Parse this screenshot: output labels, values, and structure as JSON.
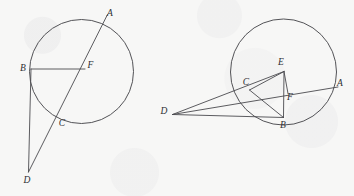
{
  "page": {
    "width": 354,
    "height": 196,
    "background_color": "#f7f7f6",
    "ink_color": "#4a4a4e",
    "label_color": "#2e2e32"
  },
  "figures": [
    {
      "id": "figure-left",
      "name": "left-circle-diagram",
      "circle": {
        "cx": 81.5,
        "cy": 71.5,
        "r": 52.0
      },
      "points": [
        {
          "id": "A",
          "label": "A",
          "x": 104.0,
          "y": 21.5,
          "label_x": 110.0,
          "label_y": 14.0
        },
        {
          "id": "B",
          "label": "B",
          "x": 31.0,
          "y": 69.0,
          "label_x": 23.0,
          "label_y": 69.0
        },
        {
          "id": "F",
          "label": "F",
          "x": 84.5,
          "y": 69.0,
          "label_x": 90.5,
          "label_y": 66.0
        },
        {
          "id": "C",
          "label": "C",
          "x": 57.5,
          "y": 116.5,
          "label_x": 62.0,
          "label_y": 124.0
        },
        {
          "id": "D",
          "label": "D",
          "x": 28.5,
          "y": 172.0,
          "label_x": 27.0,
          "label_y": 180.5
        }
      ],
      "segments": [
        {
          "name": "chord-B-F",
          "from": "B",
          "to": "F"
        },
        {
          "name": "line-A-D",
          "from": "A",
          "to": "D"
        },
        {
          "name": "line-B-D",
          "from": "B",
          "to": "D"
        }
      ],
      "notes": "Line A-D passes through the circle, crossing it at A and C; B and F lie on a horizontal chord/radius; D lies outside below"
    },
    {
      "id": "figure-right",
      "name": "right-circle-diagram",
      "circle": {
        "cx": 283.5,
        "cy": 72.0,
        "r": 53.0
      },
      "points": [
        {
          "id": "E",
          "label": "E",
          "x": 284.0,
          "y": 71.5,
          "label_x": 281.0,
          "label_y": 62.5
        },
        {
          "id": "A",
          "label": "A",
          "x": 334.0,
          "y": 87.5,
          "label_x": 340.0,
          "label_y": 84.0
        },
        {
          "id": "C",
          "label": "C",
          "x": 249.5,
          "y": 90.0,
          "label_x": 246.0,
          "label_y": 83.0
        },
        {
          "id": "F",
          "label": "F",
          "x": 287.5,
          "y": 93.0,
          "label_x": 290.0,
          "label_y": 97.5
        },
        {
          "id": "B",
          "label": "B",
          "x": 283.5,
          "y": 117.5,
          "label_x": 283.0,
          "label_y": 126.0
        },
        {
          "id": "D",
          "label": "D",
          "x": 172.5,
          "y": 114.5,
          "label_x": 164.0,
          "label_y": 112.0
        }
      ],
      "segments": [
        {
          "name": "line-D-A",
          "from": "D",
          "to": "A"
        },
        {
          "name": "line-D-B",
          "from": "D",
          "to": "B"
        },
        {
          "name": "line-D-E",
          "from": "D",
          "to": "E"
        },
        {
          "name": "segment-E-C",
          "from": "E",
          "to": "C"
        },
        {
          "name": "segment-E-F",
          "from": "E",
          "to": "F"
        },
        {
          "name": "segment-E-B",
          "from": "E",
          "to": "B"
        },
        {
          "name": "segment-C-B",
          "from": "C",
          "to": "B"
        }
      ],
      "notes": "E is circle center; D outside left; secant D-A cuts circle at C and A; D-B tangent-like to B at bottom of circle; F is foot on segment"
    }
  ]
}
